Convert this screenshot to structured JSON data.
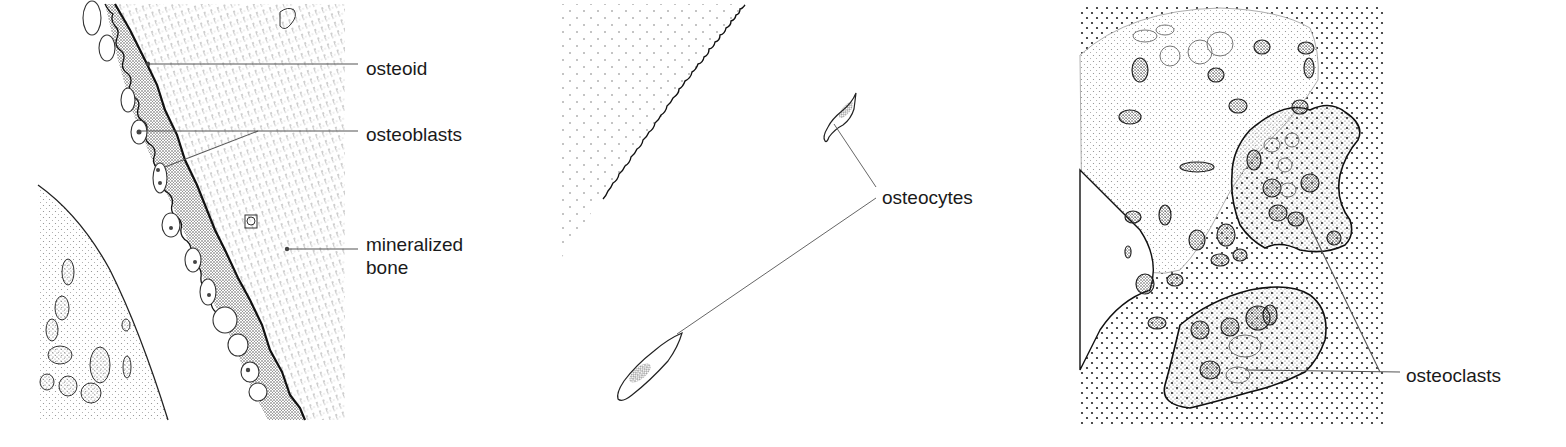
{
  "figure": {
    "panels": [
      {
        "id": "bone-formation",
        "labels": [
          {
            "text": "osteoid",
            "x": 366,
            "y": 58
          },
          {
            "text": "osteoblasts",
            "x": 366,
            "y": 124
          },
          {
            "text": "mineralized",
            "x": 366,
            "y": 234
          },
          {
            "text": "bone",
            "x": 366,
            "y": 257
          }
        ]
      },
      {
        "id": "osteocytes-panel",
        "labels": [
          {
            "text": "osteocytes",
            "x": 882,
            "y": 187
          }
        ]
      },
      {
        "id": "bone-resorption",
        "labels": [
          {
            "text": "osteoclasts",
            "x": 1406,
            "y": 365
          }
        ]
      }
    ],
    "colors": {
      "ink": "#1a1a1a",
      "leader": "#555555",
      "stipple": "#6a6a6a",
      "background": "#ffffff"
    }
  }
}
